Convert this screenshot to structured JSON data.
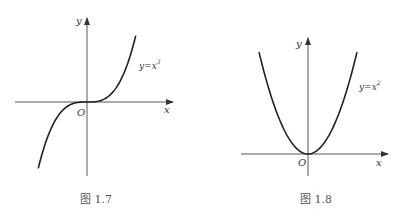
{
  "figures": [
    {
      "id": "fig-1-7",
      "function": "x^3",
      "curve_label": "y=x",
      "curve_label_exp": "3",
      "axis_x_label": "x",
      "axis_y_label": "y",
      "origin_label": "O",
      "caption": "图 1.7",
      "x_range": [
        -1.25,
        1.25
      ]
    },
    {
      "id": "fig-1-8",
      "function": "x^2",
      "curve_label": "y=x",
      "curve_label_exp": "2",
      "axis_x_label": "x",
      "axis_y_label": "y",
      "origin_label": "O",
      "caption": "图 1.8",
      "x_range": [
        -1.4,
        1.4
      ]
    }
  ]
}
